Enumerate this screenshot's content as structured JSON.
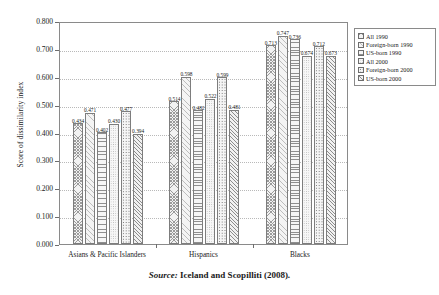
{
  "chart_data": {
    "type": "bar",
    "title": "",
    "xlabel": "",
    "ylabel": "Score of dissimilarity index",
    "ylim": [
      0.0,
      0.8
    ],
    "ytick_labels": [
      "0.000",
      "0.100",
      "0.200",
      "0.300",
      "0.400",
      "0.500",
      "0.600",
      "0.700",
      "0.800"
    ],
    "ytick_values": [
      0.0,
      0.1,
      0.2,
      0.3,
      0.4,
      0.5,
      0.6,
      0.7,
      0.8
    ],
    "grid": true,
    "legend_position": "right-outside",
    "categories": [
      "Asians & Pacific Islanders",
      "Hispanics",
      "Blacks"
    ],
    "series": [
      {
        "name": "All 1990",
        "pattern": "dense-crosshatch",
        "values": [
          0.434,
          0.514,
          0.713
        ]
      },
      {
        "name": "Foreign-born 1990",
        "pattern": "light-diagonal",
        "values": [
          0.471,
          0.598,
          0.747
        ]
      },
      {
        "name": "US-born 1990",
        "pattern": "horizontal-lines",
        "values": [
          0.402,
          0.482,
          0.736
        ]
      },
      {
        "name": "All 2000",
        "pattern": "fine-stipple",
        "values": [
          0.43,
          0.522,
          0.674
        ]
      },
      {
        "name": "Foreign-born 2000",
        "pattern": "bold-dots",
        "values": [
          0.477,
          0.599,
          0.712
        ]
      },
      {
        "name": "US-born 2000",
        "pattern": "diagonal-hatch",
        "values": [
          0.394,
          0.481,
          0.673
        ]
      }
    ],
    "data_labels": [
      [
        "0.434",
        "0.471",
        "0.402",
        "0.430",
        "0.477",
        "0.394"
      ],
      [
        "0.514",
        "0.598",
        "0.482",
        "0.522",
        "0.599",
        "0.481"
      ],
      [
        "0.713",
        "0.747",
        "0.736",
        "0.674",
        "0.712",
        "0.673"
      ]
    ]
  },
  "legend": {
    "items": [
      {
        "label": "All 1990"
      },
      {
        "label": "Foreign-born 1990"
      },
      {
        "label": "US-born 1990"
      },
      {
        "label": "All 2000"
      },
      {
        "label": "Foreign-born 2000"
      },
      {
        "label": "US-born 2000"
      }
    ]
  },
  "source": {
    "word": "Source:",
    "text": "Iceland and Scopilliti (2008)."
  }
}
